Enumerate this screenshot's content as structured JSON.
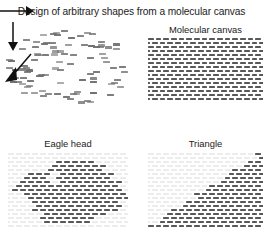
{
  "figure": {
    "title": "Design of arbitrary shapes from a molecular canvas",
    "background_color": "#ffffff",
    "width": 263,
    "height": 231
  },
  "panels": {
    "loose_tiles": {
      "name": "loose molecular tiles",
      "tile_color": "#6e6e6e",
      "tile_count": 96
    },
    "canvas": {
      "label": "Molecular canvas",
      "pattern": "brick-lattice",
      "dark_tile_color": "#585858",
      "light_tile_color": "#dedede",
      "rows": 16,
      "columns": 16
    },
    "eagle": {
      "label": "Eagle head",
      "pattern": "brick-lattice",
      "dark_tile_color": "#585858",
      "light_tile_color": "#ececec",
      "rows": 19,
      "columns": 16
    },
    "triangle": {
      "label": "Triangle",
      "pattern": "brick-lattice",
      "dark_tile_color": "#585858",
      "light_tile_color": "#ececec",
      "rows": 19,
      "columns": 16
    }
  },
  "arrows": [
    {
      "name": "arrow-to-canvas",
      "direction": "right"
    },
    {
      "name": "arrow-to-eagle",
      "direction": "down"
    },
    {
      "name": "arrow-to-triangle",
      "direction": "down-left"
    }
  ],
  "chart_data": {
    "type": "diagram",
    "title": "Design of arbitrary shapes from a molecular canvas",
    "nodes": [
      {
        "id": "tiles",
        "label": "",
        "role": "loose single-stranded tiles"
      },
      {
        "id": "canvas",
        "label": "Molecular canvas",
        "role": "full rectangular lattice"
      },
      {
        "id": "eagle",
        "label": "Eagle head",
        "role": "shape selected from canvas"
      },
      {
        "id": "triangle",
        "label": "Triangle",
        "role": "shape selected from canvas"
      }
    ],
    "edges": [
      {
        "from": "tiles",
        "to": "canvas",
        "style": "arrow-right"
      },
      {
        "from": "canvas",
        "to": "eagle",
        "style": "arrow-down"
      },
      {
        "from": "canvas",
        "to": "triangle",
        "style": "arrow-down-left"
      }
    ]
  }
}
